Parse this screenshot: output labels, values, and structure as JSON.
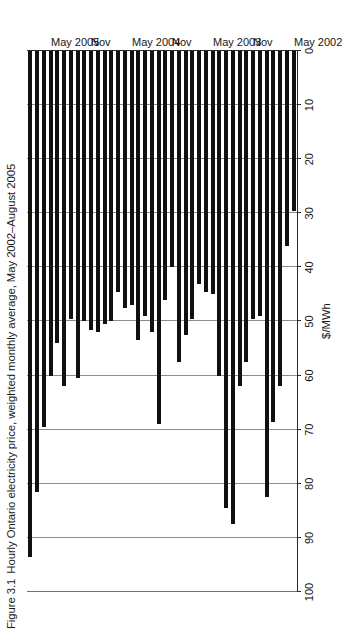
{
  "figure": {
    "number": "Figure 3.1",
    "title": "Hourly Ontario electricity price, weighted monthly average, May 2002–August 2005"
  },
  "colors": {
    "bar": "#111111",
    "gridline": "#8d8d8d",
    "axis": "#2b2b2b",
    "text": "#161616",
    "background": "#ffffff"
  },
  "axis": {
    "value_axis_title": "$/MWh",
    "value_ticks": [
      0,
      10,
      20,
      30,
      40,
      50,
      60,
      70,
      80,
      90,
      100
    ],
    "value_min": 0,
    "value_max": 100,
    "category_tick_labels": [
      "May 2002",
      "Nov",
      "May 2003",
      "Nov",
      "May 2004",
      "Nov",
      "May 2005"
    ]
  },
  "chart_data": {
    "type": "bar",
    "orientation": "horizontal",
    "title": "Hourly Ontario electricity price, weighted monthly average, May 2002–August 2005",
    "xlabel": "$/MWh",
    "ylabel": "",
    "xlim": [
      0,
      100
    ],
    "grid": true,
    "legend": null,
    "categories": [
      "May 2002",
      "Jun 2002",
      "Jul 2002",
      "Aug 2002",
      "Sep 2002",
      "Oct 2002",
      "Nov 2002",
      "Dec 2002",
      "Jan 2003",
      "Feb 2003",
      "Mar 2003",
      "Apr 2003",
      "May 2003",
      "Jun 2003",
      "Jul 2003",
      "Aug 2003",
      "Sep 2003",
      "Oct 2003",
      "Nov 2003",
      "Dec 2003",
      "Jan 2004",
      "Feb 2004",
      "Mar 2004",
      "Apr 2004",
      "May 2004",
      "Jun 2004",
      "Jul 2004",
      "Aug 2004",
      "Sep 2004",
      "Oct 2004",
      "Nov 2004",
      "Dec 2004",
      "Jan 2005",
      "Feb 2005",
      "Mar 2005",
      "Apr 2005",
      "May 2005",
      "Jun 2005",
      "Jul 2005",
      "Aug 2005"
    ],
    "values": [
      29.5,
      36.0,
      62.0,
      68.5,
      82.5,
      49.0,
      49.5,
      57.5,
      62.0,
      87.5,
      84.5,
      60.0,
      45.0,
      44.5,
      43.0,
      49.5,
      52.5,
      57.5,
      40.0,
      46.0,
      69.0,
      52.0,
      49.0,
      53.5,
      47.0,
      47.5,
      44.5,
      50.0,
      50.5,
      52.0,
      51.5,
      50.0,
      60.5,
      49.5,
      62.0,
      54.0,
      60.0,
      69.5,
      81.5,
      93.5
    ],
    "units": "$/MWh"
  },
  "labels": {
    "value_axis_ticks": [
      "0",
      "10",
      "20",
      "30",
      "40",
      "50",
      "60",
      "70",
      "80",
      "90",
      "100"
    ]
  }
}
